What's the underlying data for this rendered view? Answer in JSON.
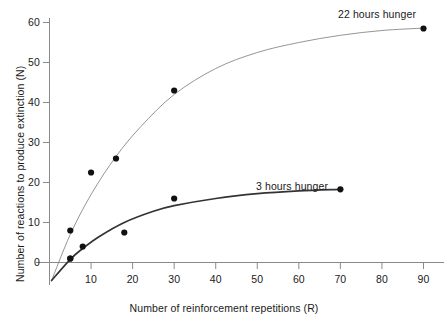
{
  "chart_data": {
    "type": "scatter",
    "title": "",
    "subtitle": "",
    "xlabel": "Number of reinforcement repetitions (R)",
    "ylabel": "Number of reactions to produce extinction (N)",
    "xlim": [
      0,
      93
    ],
    "ylim": [
      -5,
      62
    ],
    "xticks": [
      10,
      20,
      30,
      40,
      50,
      60,
      70,
      80,
      90
    ],
    "xtick_labels": [
      "10",
      "20",
      "30",
      "40",
      "50",
      "60",
      "70",
      "80",
      "90"
    ],
    "yticks": [
      0,
      10,
      20,
      30,
      40,
      50,
      60
    ],
    "ytick_labels": [
      "0",
      "10",
      "20",
      "30",
      "40",
      "50",
      "60"
    ],
    "grid": false,
    "legend_position": "inline-annotation",
    "series": [
      {
        "name": "22 hours hunger",
        "label": "22 hours hunger",
        "color": "#7a7a7a",
        "marker_color": "#111111",
        "line_width": 0.8,
        "points": [
          {
            "x": 5,
            "y": 1
          },
          {
            "x": 5,
            "y": 8
          },
          {
            "x": 10,
            "y": 22.5
          },
          {
            "x": 16,
            "y": 26
          },
          {
            "x": 30,
            "y": 43
          },
          {
            "x": 90,
            "y": 58.5
          }
        ],
        "curve": [
          {
            "x": 0.5,
            "y": -4.5
          },
          {
            "x": 5,
            "y": 7
          },
          {
            "x": 10,
            "y": 17
          },
          {
            "x": 16,
            "y": 26.5
          },
          {
            "x": 22,
            "y": 34
          },
          {
            "x": 30,
            "y": 42
          },
          {
            "x": 40,
            "y": 48.5
          },
          {
            "x": 50,
            "y": 52.5
          },
          {
            "x": 60,
            "y": 55
          },
          {
            "x": 70,
            "y": 56.8
          },
          {
            "x": 80,
            "y": 58
          },
          {
            "x": 90,
            "y": 58.6
          }
        ]
      },
      {
        "name": "3 hours hunger",
        "label": "3 hours hunger",
        "color": "#333333",
        "marker_color": "#111111",
        "line_width": 1.7,
        "points": [
          {
            "x": 5,
            "y": 1
          },
          {
            "x": 8,
            "y": 4
          },
          {
            "x": 18,
            "y": 7.5
          },
          {
            "x": 30,
            "y": 16
          },
          {
            "x": 70,
            "y": 18.3
          }
        ],
        "curve": [
          {
            "x": 0.5,
            "y": -4.5
          },
          {
            "x": 5,
            "y": 0.8
          },
          {
            "x": 8,
            "y": 3.5
          },
          {
            "x": 12,
            "y": 6.5
          },
          {
            "x": 18,
            "y": 10
          },
          {
            "x": 25,
            "y": 12.8
          },
          {
            "x": 30,
            "y": 14.2
          },
          {
            "x": 40,
            "y": 16
          },
          {
            "x": 50,
            "y": 17.2
          },
          {
            "x": 60,
            "y": 17.9
          },
          {
            "x": 70,
            "y": 18.3
          }
        ]
      }
    ]
  },
  "axes": {
    "x_title": "Number of reinforcement repetitions (R)",
    "y_title": "Number of reactions to produce extinction (N)"
  }
}
